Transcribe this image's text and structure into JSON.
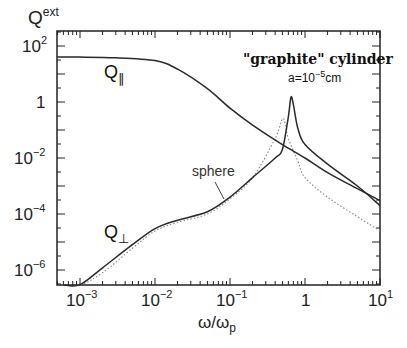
{
  "chart_data": {
    "type": "line",
    "title": "\"graphite\" cylinder",
    "subtitle": "a=10^-5 cm",
    "xlabel": "ω/ω_p",
    "ylabel": "Q^ext",
    "xscale": "log",
    "yscale": "log",
    "xlim": [
      0.0005,
      10
    ],
    "ylim": [
      1e-07,
      300
    ],
    "x_ticks": [
      "10^-3",
      "10^-2",
      "10^-1",
      "1",
      "10^1"
    ],
    "y_ticks": [
      "10^-6",
      "10^-4",
      "10^-2",
      "1",
      "10^2"
    ],
    "grid": false,
    "legend": "inline labels",
    "series": [
      {
        "name": "Q_parallel",
        "style": "solid",
        "x": [
          0.0005,
          0.001,
          0.003,
          0.01,
          0.02,
          0.05,
          0.1,
          0.2,
          0.5,
          1,
          2,
          5,
          10
        ],
        "y": [
          40,
          40,
          38,
          30,
          15,
          3,
          0.6,
          0.15,
          0.03,
          0.01,
          0.003,
          0.0008,
          0.0003
        ]
      },
      {
        "name": "Q_perp",
        "style": "solid",
        "x": [
          0.0006,
          0.001,
          0.002,
          0.005,
          0.01,
          0.02,
          0.05,
          0.1,
          0.2,
          0.4,
          0.5,
          0.6,
          0.65,
          0.7,
          0.8,
          1,
          2,
          5,
          10
        ],
        "y": [
          1e-07,
          3e-07,
          1.2e-06,
          8e-06,
          3e-05,
          6e-05,
          0.00012,
          0.0004,
          0.002,
          0.01,
          0.02,
          0.3,
          1.5,
          0.8,
          0.12,
          0.03,
          0.006,
          0.001,
          0.0002
        ]
      },
      {
        "name": "sphere",
        "style": "dotted",
        "x": [
          0.0006,
          0.001,
          0.002,
          0.005,
          0.01,
          0.02,
          0.05,
          0.1,
          0.2,
          0.4,
          0.5,
          0.55,
          0.6,
          0.8,
          1,
          2,
          5,
          10
        ],
        "y": [
          8e-08,
          2e-07,
          8e-07,
          6e-06,
          2.5e-05,
          5e-05,
          0.0001,
          0.00035,
          0.002,
          0.05,
          0.25,
          0.15,
          0.05,
          0.008,
          0.002,
          0.0004,
          8e-05,
          2.5e-05
        ]
      }
    ],
    "annotations": [
      "Q_∥",
      "Q_⊥",
      "sphere",
      "\"graphite\" cylinder",
      "a=10^-5 cm"
    ]
  },
  "labels": {
    "ylabel_base": "Q",
    "ylabel_sup": "ext",
    "xlabel": "ω/ω",
    "xlabel_sub": "p",
    "title": "\"graphite\" cylinder",
    "sub_prefix": "a=10",
    "sub_exp": "−5",
    "sub_unit": "cm",
    "q_par_base": "Q",
    "q_par_sub": "∥",
    "q_perp_base": "Q",
    "q_perp_sub": "⊥",
    "sphere": "sphere",
    "x_tick_base": [
      "10",
      "10",
      "10",
      "1",
      "10"
    ],
    "x_tick_exp": [
      "−3",
      "−2",
      "−1",
      "",
      "1"
    ],
    "y_tick_base": [
      "10",
      "1",
      "10",
      "10",
      "10"
    ],
    "y_tick_exp": [
      "2",
      "",
      "−2",
      "−4",
      "−6"
    ]
  },
  "colors": {
    "curve": "#2a2a2a",
    "dotted": "#888888",
    "axis": "#222222"
  }
}
